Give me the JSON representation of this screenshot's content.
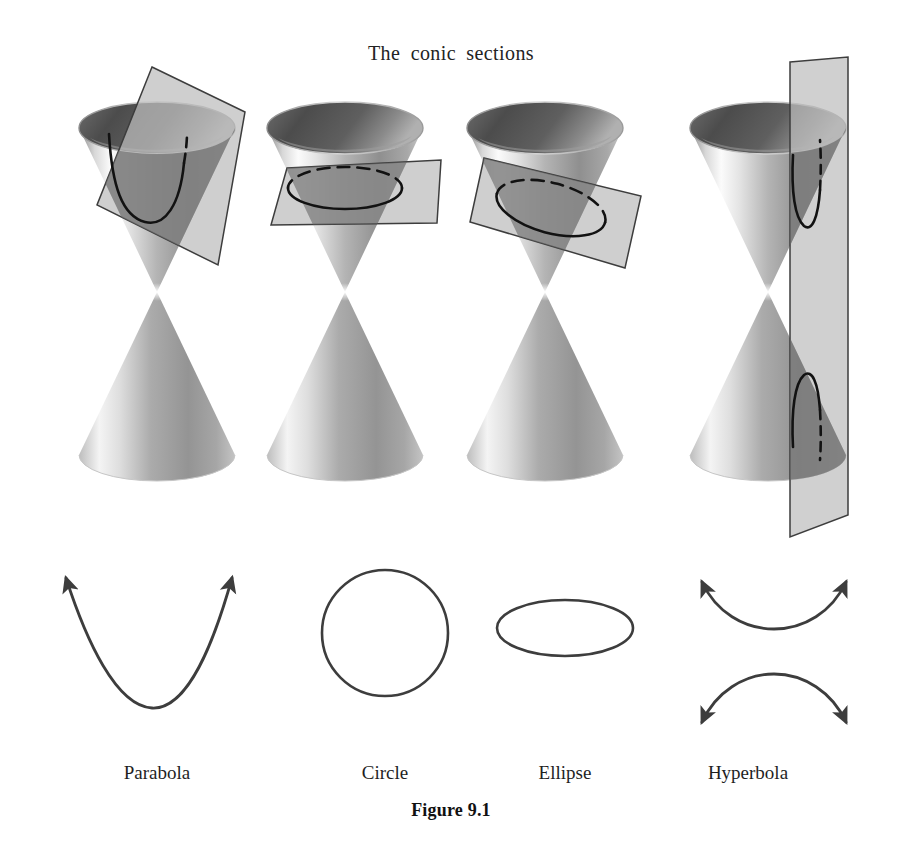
{
  "figure": {
    "title": "The  conic  sections",
    "caption": "Figure 9.1",
    "background_color": "#ffffff",
    "ink_color": "#1f1f1f"
  },
  "panels": [
    {
      "id": "parabola",
      "label": "Parabola",
      "cut_description": "plane parallel to one generating line, tilted through a single nappe",
      "curve_type": "parabola",
      "plane_orientation": "tilted",
      "intersects_nappes": 1,
      "curve_has_arrows": true,
      "curve_arrow_count": 2,
      "cone_center_x": 157
    },
    {
      "id": "circle",
      "label": "Circle",
      "cut_description": "plane perpendicular to the cone axis",
      "curve_type": "circle",
      "plane_orientation": "horizontal",
      "intersects_nappes": 1,
      "curve_has_arrows": false,
      "curve_arrow_count": 0,
      "cone_center_x": 345
    },
    {
      "id": "ellipse",
      "label": "Ellipse",
      "cut_description": "plane oblique to the axis cutting completely across one nappe",
      "curve_type": "ellipse",
      "plane_orientation": "oblique",
      "intersects_nappes": 1,
      "curve_has_arrows": false,
      "curve_arrow_count": 0,
      "cone_center_x": 545
    },
    {
      "id": "hyperbola",
      "label": "Hyperbola",
      "cut_description": "vertical plane parallel to the axis cutting both nappes",
      "curve_type": "hyperbola",
      "plane_orientation": "vertical",
      "intersects_nappes": 2,
      "curve_has_arrows": true,
      "curve_arrow_count": 4,
      "cone_center_x": 768
    }
  ],
  "colors": {
    "cone_dark": "#585858",
    "cone_mid": "#a0a0a0",
    "cone_light": "#f2f2f2",
    "cone_interior_dark": "#4f4f4f",
    "plane_fill": "#b9b9b9",
    "plane_fill_overlap": "#7e7e7e",
    "plane_stroke": "#3a3a3a",
    "section_curve": "#141414",
    "curve_stroke": "#3d3d3d"
  },
  "geometry": {
    "image_width": 902,
    "image_height": 855,
    "cone_apex_y": 292,
    "cone_top_rim_y": 128,
    "cone_top_rim_rx": 78,
    "cone_top_rim_ry": 26,
    "cone_bottom_rim_y": 455,
    "cone_bottom_rim_rx": 78,
    "cone_bottom_rim_ry": 26,
    "curve_row_y": 633
  }
}
